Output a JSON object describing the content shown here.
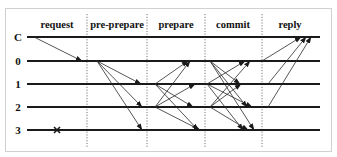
{
  "phases": [
    {
      "id": "request",
      "label": "request"
    },
    {
      "id": "pre-prepare",
      "label": "pre-prepare"
    },
    {
      "id": "prepare",
      "label": "prepare"
    },
    {
      "id": "commit",
      "label": "commit"
    },
    {
      "id": "reply",
      "label": "reply"
    }
  ],
  "nodes": [
    {
      "id": "C",
      "label": "C",
      "role": "client"
    },
    {
      "id": "0",
      "label": "0",
      "role": "primary"
    },
    {
      "id": "1",
      "label": "1",
      "role": "replica"
    },
    {
      "id": "2",
      "label": "2",
      "role": "replica"
    },
    {
      "id": "3",
      "label": "3",
      "role": "replica",
      "faulty": true
    }
  ],
  "failure_marker": {
    "node": "3",
    "glyph": "×",
    "phase": "request"
  },
  "messages": [
    {
      "phase": "request",
      "from": "C",
      "to": "0"
    },
    {
      "phase": "pre-prepare",
      "from": "0",
      "to": "1"
    },
    {
      "phase": "pre-prepare",
      "from": "0",
      "to": "2"
    },
    {
      "phase": "pre-prepare",
      "from": "0",
      "to": "3"
    },
    {
      "phase": "prepare",
      "from": "1",
      "to": "0"
    },
    {
      "phase": "prepare",
      "from": "1",
      "to": "2"
    },
    {
      "phase": "prepare",
      "from": "1",
      "to": "3"
    },
    {
      "phase": "prepare",
      "from": "2",
      "to": "0"
    },
    {
      "phase": "prepare",
      "from": "2",
      "to": "1"
    },
    {
      "phase": "prepare",
      "from": "2",
      "to": "3"
    },
    {
      "phase": "commit",
      "from": "0",
      "to": "1"
    },
    {
      "phase": "commit",
      "from": "0",
      "to": "2"
    },
    {
      "phase": "commit",
      "from": "0",
      "to": "3"
    },
    {
      "phase": "commit",
      "from": "1",
      "to": "0"
    },
    {
      "phase": "commit",
      "from": "1",
      "to": "2"
    },
    {
      "phase": "commit",
      "from": "1",
      "to": "3"
    },
    {
      "phase": "commit",
      "from": "2",
      "to": "0"
    },
    {
      "phase": "commit",
      "from": "2",
      "to": "1"
    },
    {
      "phase": "commit",
      "from": "2",
      "to": "3"
    },
    {
      "phase": "reply",
      "from": "0",
      "to": "C"
    },
    {
      "phase": "reply",
      "from": "1",
      "to": "C"
    },
    {
      "phase": "reply",
      "from": "2",
      "to": "C"
    }
  ]
}
